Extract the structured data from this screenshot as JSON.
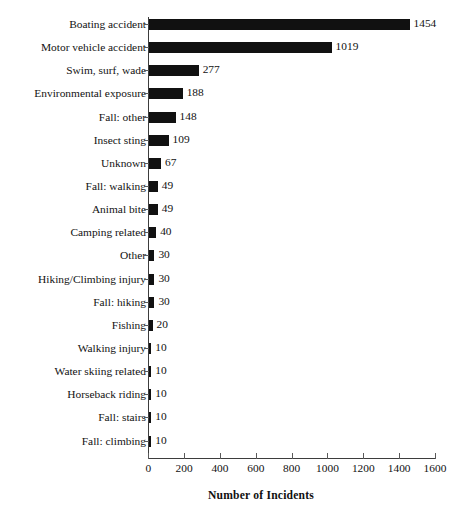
{
  "chart_data": {
    "type": "bar",
    "orientation": "horizontal",
    "title": "",
    "xlabel": "Number of Incidents",
    "ylabel": "",
    "xlim": [
      0,
      1600
    ],
    "xticks": [
      0,
      200,
      400,
      600,
      800,
      1000,
      1200,
      1400,
      1600
    ],
    "grid": false,
    "legend": null,
    "bar_color": "#111111",
    "axis_color": "#3d3d3d",
    "show_value_labels": true,
    "categories": [
      "Boating accident",
      "Motor vehicle accident",
      "Swim, surf, wade",
      "Environmental exposure",
      "Fall: other",
      "Insect sting",
      "Unknown",
      "Fall: walking",
      "Animal bite",
      "Camping related",
      "Other",
      "Hiking/Climbing injury",
      "Fall: hiking",
      "Fishing",
      "Walking injury",
      "Water skiing related",
      "Horseback riding",
      "Fall: stairs",
      "Fall: climbing"
    ],
    "values": [
      1454,
      1019,
      277,
      188,
      148,
      109,
      67,
      49,
      49,
      40,
      30,
      30,
      30,
      20,
      10,
      10,
      10,
      10,
      10
    ],
    "value_labels": [
      "1454",
      "1019",
      "277",
      "188",
      "148",
      "109",
      "67",
      "49",
      "49",
      "40",
      "30",
      "30",
      "30",
      "20",
      "10",
      "10",
      "10",
      "10",
      "10"
    ],
    "xtick_labels": [
      "0",
      "200",
      "400",
      "600",
      "800",
      "1000",
      "1200",
      "1400",
      "1600"
    ]
  }
}
